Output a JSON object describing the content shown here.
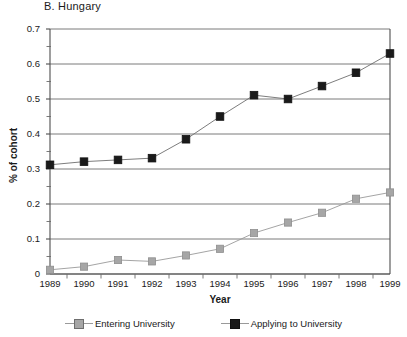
{
  "chart_data": {
    "type": "line",
    "title": "B.  Hungary",
    "xlabel": "Year",
    "ylabel": "% of cohort",
    "categories": [
      "1989",
      "1990",
      "1991",
      "1992",
      "1993",
      "1994",
      "1995",
      "1996",
      "1997",
      "1998",
      "1999"
    ],
    "ylim": [
      0,
      0.7
    ],
    "ytick_labels": [
      "0",
      "0.1",
      "0.2",
      "0.3",
      "0.4",
      "0.5",
      "0.6",
      "0.7"
    ],
    "ytick_values": [
      0,
      0.1,
      0.2,
      0.3,
      0.4,
      0.5,
      0.6,
      0.7
    ],
    "yminor_step": 0.05,
    "grid": "horizontal",
    "legend_position": "bottom",
    "series": [
      {
        "name": "Entering University",
        "color": "#a6a6a6",
        "marker": "square",
        "values": [
          0.012,
          0.021,
          0.04,
          0.036,
          0.053,
          0.072,
          0.117,
          0.147,
          0.175,
          0.215,
          0.233
        ]
      },
      {
        "name": "Applying to University",
        "color": "#1a1a1a",
        "marker": "square",
        "values": [
          0.312,
          0.321,
          0.326,
          0.331,
          0.385,
          0.45,
          0.511,
          0.5,
          0.537,
          0.575,
          0.63
        ]
      }
    ]
  },
  "legend": {
    "items": [
      {
        "label": "Entering University"
      },
      {
        "label": "Applying to University"
      }
    ]
  }
}
